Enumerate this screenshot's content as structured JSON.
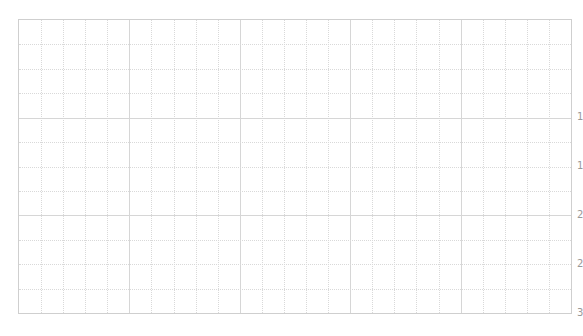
{
  "chart_data": {
    "type": "line",
    "title": "",
    "xlabel": "",
    "ylabel": "",
    "series": [],
    "grid": true,
    "x_major_divisions": 5,
    "x_minor_per_major": 5,
    "y_major_divisions": 3,
    "y_minor_per_major": 4,
    "right_axis_tick_labels": [
      "1",
      "1",
      "2",
      "2",
      "3"
    ],
    "right_axis_tick_positions_px": [
      117,
      166,
      215,
      264,
      313
    ],
    "colors": {
      "frame": "#cfcfcf",
      "major_grid": "#d6d6d6",
      "minor_grid": "#d9d9d9",
      "tick_text": "#999999"
    }
  }
}
